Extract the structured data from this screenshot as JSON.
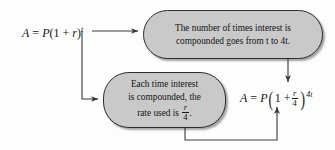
{
  "diagram": {
    "colors": {
      "box_fill": "#c9c9c9",
      "box_border": "#2e2e2e",
      "line": "#3a3a3a",
      "text": "#141414",
      "background": "#fdfdfd"
    },
    "formula_left": {
      "full_text": "A = P(1 + r)^t",
      "lhs": "A",
      "equals": "=",
      "coefficient": "P",
      "open_paren": "(",
      "one": "1",
      "plus": "+",
      "rate": "r",
      "close_paren": ")",
      "exponent": "t"
    },
    "formula_right": {
      "full_text": "A = P(1 + r/4)^4t",
      "lhs": "A",
      "equals": "=",
      "coefficient": "P",
      "open_paren": "(",
      "one": "1",
      "plus": "+",
      "fraction_numerator": "r",
      "fraction_denominator": "4",
      "close_paren": ")",
      "exponent": "4t"
    },
    "box_top": {
      "line1": "The number of times interest is",
      "line2_pre": "compounded goes from ",
      "line2_var1": "t",
      "line2_mid": " to 4",
      "line2_var2": "t",
      "line2_end": "."
    },
    "box_bottom": {
      "line1": "Each time interest",
      "line2": "is compounded, the",
      "line3_pre": "rate used is ",
      "fraction_numerator": "r",
      "fraction_denominator": "4",
      "line3_end": "."
    },
    "arrows": [
      {
        "name": "left-formula-to-top-box",
        "from": "formula_left",
        "to": "box_top"
      },
      {
        "name": "left-formula-to-bottom-box",
        "from": "formula_left",
        "to": "box_bottom"
      },
      {
        "name": "top-box-to-right-formula",
        "from": "box_top",
        "to": "formula_right"
      },
      {
        "name": "bottom-box-to-right-formula",
        "from": "box_bottom",
        "to": "formula_right"
      }
    ]
  }
}
